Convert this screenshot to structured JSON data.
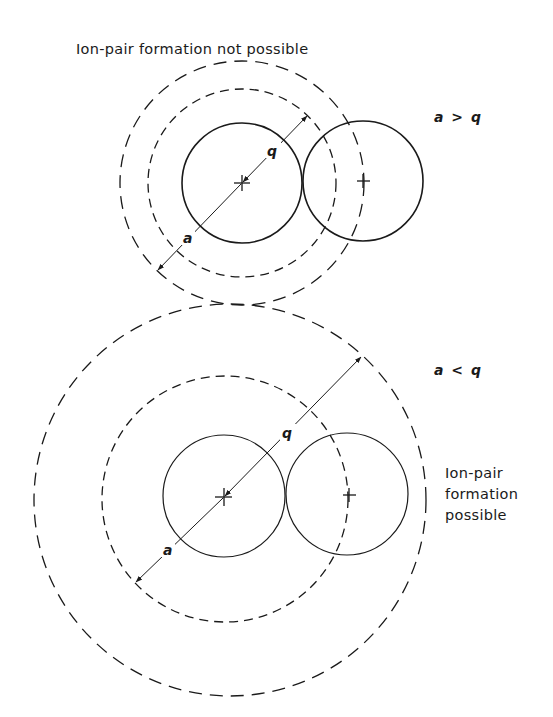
{
  "diagram": {
    "top_panel": {
      "caption": "Ion-pair formation not possible",
      "condition": "a > q",
      "label_q": "q",
      "label_a": "a",
      "description": "Inner dashed circle radius q is smaller than outer dashed circle radius a (a > q); second ion lies outside q-sphere"
    },
    "bottom_panel": {
      "caption_lines": [
        "Ion-pair",
        "formation",
        "possible"
      ],
      "condition": "a < q",
      "label_q": "q",
      "label_a": "a",
      "description": "Inner dashed circle radius a is smaller than outer dashed circle radius q (a < q); second ion lies inside q-sphere"
    },
    "icons": {
      "ion_center_marker": "plus-cross",
      "arrowhead": "filled-triangle"
    },
    "colors": {
      "ink": "#1a1a1a",
      "paper": "#ffffff"
    }
  }
}
